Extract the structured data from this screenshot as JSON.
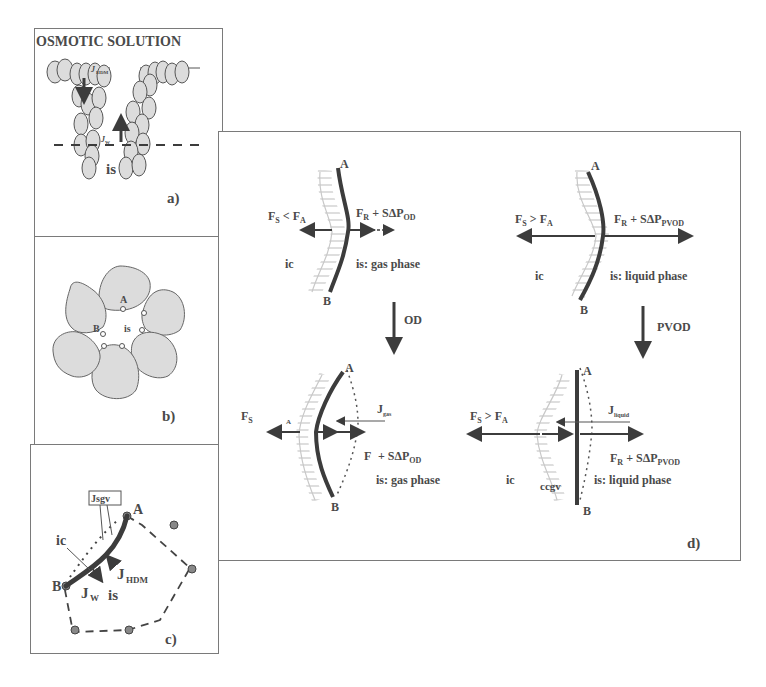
{
  "figure": {
    "panels": {
      "a": {
        "title": "OSMOTIC SOLUTION",
        "label": "a)",
        "flux_down": "J",
        "flux_down_sub": "HDM",
        "flux_up": "J",
        "flux_up_sub": "W",
        "region": "is"
      },
      "b": {
        "label": "b)",
        "point_a": "A",
        "point_b": "B",
        "region": "is"
      },
      "c": {
        "label": "c)",
        "box_label": "Jsgv",
        "point_a": "A",
        "point_b": "B",
        "ic": "ic",
        "is": "is",
        "jw": "J",
        "jw_sub": "W",
        "jhdm": "J",
        "jhdm_sub": "HDM"
      },
      "d": {
        "label": "d)",
        "top_left": {
          "point_a": "A",
          "point_b": "B",
          "fs": "F",
          "fs_sub": "S",
          "cmp": " < F",
          "fa_sub": "A",
          "fr": "F",
          "fr_sub": "R",
          "plus": " + SΔP",
          "dp_sub": "OD",
          "ic": "ic",
          "phase": "is: gas phase"
        },
        "top_right": {
          "point_a": "A",
          "point_b": "B",
          "fs": "F",
          "fs_sub": "S",
          "cmp": " > F",
          "fa_sub": "A",
          "fr": "F",
          "fr_sub": "R",
          "plus": " + SΔP",
          "dp_sub": "PVOD",
          "ic": "ic",
          "phase": "is: liquid phase"
        },
        "arrow_left": "OD",
        "arrow_right": "PVOD",
        "bottom_left": {
          "point_a": "A",
          "point_b": "B",
          "fs": "F",
          "fs_sub": "S",
          "fa_sub": "A",
          "j": "J",
          "j_sub": "gas",
          "f": "F",
          "plus": " + SΔP",
          "dp_sub": "OD",
          "phase": "is: gas phase"
        },
        "bottom_right": {
          "point_a": "A",
          "point_b": "B",
          "fs": "F",
          "fs_sub": "S",
          "cmp": " > F",
          "fa_sub": "A",
          "j": "J",
          "j_sub": "liquid",
          "fr": "F",
          "fr_sub": "R",
          "plus": " + SΔP",
          "dp_sub": "PVOD",
          "ic": "ic",
          "ccgv": "ccgv",
          "phase": "is: liquid phase"
        }
      }
    },
    "colors": {
      "stroke": "#3c3c3c",
      "cell_fill": "#dcdcdc",
      "ic_hatch": "#b8b8b8",
      "frame": "#7a7a7a"
    }
  }
}
